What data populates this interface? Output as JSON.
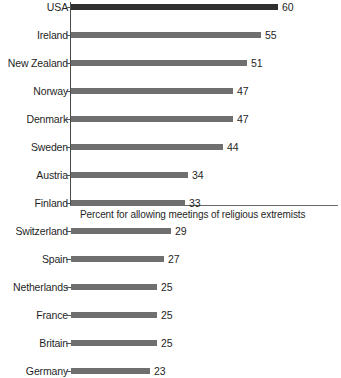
{
  "chart_data": {
    "type": "bar",
    "orientation": "horizontal",
    "title": "",
    "subtitle": "",
    "xlabel": "Percent for allowing meetings of religious extremists",
    "ylabel": "",
    "categories": [
      "USA",
      "Ireland",
      "New Zealand",
      "Norway",
      "Denmark",
      "Sweden",
      "Austria",
      "Finland",
      "Switzerland",
      "Spain",
      "Netherlands",
      "France",
      "Britain",
      "Germany"
    ],
    "values": [
      60,
      55,
      51,
      47,
      47,
      44,
      34,
      33,
      29,
      27,
      25,
      25,
      25,
      23
    ],
    "value_labels": [
      "60",
      "55",
      "51",
      "47",
      "47",
      "44",
      "34",
      "33",
      "29",
      "27",
      "25",
      "25",
      "25",
      "23"
    ],
    "xlim": [
      0,
      60
    ],
    "grid": false,
    "legend": null,
    "bar_colors": [
      "#303030",
      "#6f6f6f",
      "#6f6f6f",
      "#6f6f6f",
      "#6f6f6f",
      "#6f6f6f",
      "#6f6f6f",
      "#6f6f6f",
      "#6f6f6f",
      "#6f6f6f",
      "#6f6f6f",
      "#6f6f6f",
      "#6f6f6f",
      "#6f6f6f"
    ],
    "highlight_category": "USA",
    "colors": {
      "bar_default": "#6f6f6f",
      "bar_highlight": "#303030",
      "axis": "#4a4a4a",
      "text": "#1f1f1f",
      "background": "#ffffff"
    }
  },
  "caption": {
    "text": "Percent for allowing meetings of religious extremists"
  }
}
